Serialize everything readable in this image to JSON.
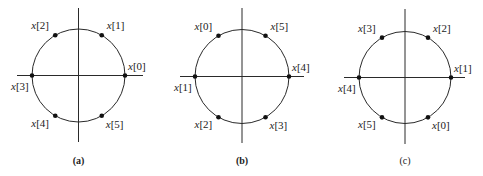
{
  "figure": {
    "panels": [
      {
        "caption": "(a)",
        "caption_bold": true,
        "center": [
          78.5,
          75.5
        ],
        "radius": 46.5,
        "h_axis": [
          17,
          143
        ],
        "v_axis": [
          8,
          142
        ],
        "points": [
          {
            "label": "x[0]",
            "angle_deg": 0,
            "label_dx": 3,
            "label_dy": -6
          },
          {
            "label": "x[1]",
            "angle_deg": 60,
            "label_dx": 5,
            "label_dy": -6
          },
          {
            "label": "x[2]",
            "angle_deg": 120,
            "label_dx": -24,
            "label_dy": -6
          },
          {
            "label": "x[3]",
            "angle_deg": 180,
            "label_dx": -21,
            "label_dy": 14
          },
          {
            "label": "x[4]",
            "angle_deg": 240,
            "label_dx": -24,
            "label_dy": 11
          },
          {
            "label": "x[5]",
            "angle_deg": 300,
            "label_dx": 4,
            "label_dy": 12
          }
        ]
      },
      {
        "caption": "(b)",
        "caption_bold": true,
        "center": [
          242,
          76.5
        ],
        "radius": 47,
        "h_axis": [
          180,
          304
        ],
        "v_axis": [
          8,
          143
        ],
        "points": [
          {
            "label": "x[4]",
            "angle_deg": 0,
            "label_dx": 3,
            "label_dy": -6
          },
          {
            "label": "x[5]",
            "angle_deg": 60,
            "label_dx": 5,
            "label_dy": -6
          },
          {
            "label": "x[0]",
            "angle_deg": 120,
            "label_dx": -24,
            "label_dy": -6
          },
          {
            "label": "x[1]",
            "angle_deg": 180,
            "label_dx": -21,
            "label_dy": 14
          },
          {
            "label": "x[2]",
            "angle_deg": 240,
            "label_dx": -24,
            "label_dy": 11
          },
          {
            "label": "x[3]",
            "angle_deg": 300,
            "label_dx": 4,
            "label_dy": 12
          }
        ]
      },
      {
        "caption": "(c)",
        "caption_bold": false,
        "center": [
          405,
          77.5
        ],
        "radius": 46,
        "h_axis": [
          344,
          465
        ],
        "v_axis": [
          9,
          144
        ],
        "points": [
          {
            "label": "x[1]",
            "angle_deg": 0,
            "label_dx": 3,
            "label_dy": -6
          },
          {
            "label": "x[2]",
            "angle_deg": 60,
            "label_dx": 5,
            "label_dy": -6
          },
          {
            "label": "x[3]",
            "angle_deg": 120,
            "label_dx": -24,
            "label_dy": -6
          },
          {
            "label": "x[4]",
            "angle_deg": 180,
            "label_dx": -21,
            "label_dy": 14
          },
          {
            "label": "x[5]",
            "angle_deg": 240,
            "label_dx": -24,
            "label_dy": 11
          },
          {
            "label": "x[0]",
            "angle_deg": 300,
            "label_dx": 4,
            "label_dy": 12
          }
        ]
      }
    ],
    "caption_y": 164,
    "colors": {
      "stroke": "#2a2a2a",
      "point": "#111111",
      "text": "#222222"
    }
  }
}
